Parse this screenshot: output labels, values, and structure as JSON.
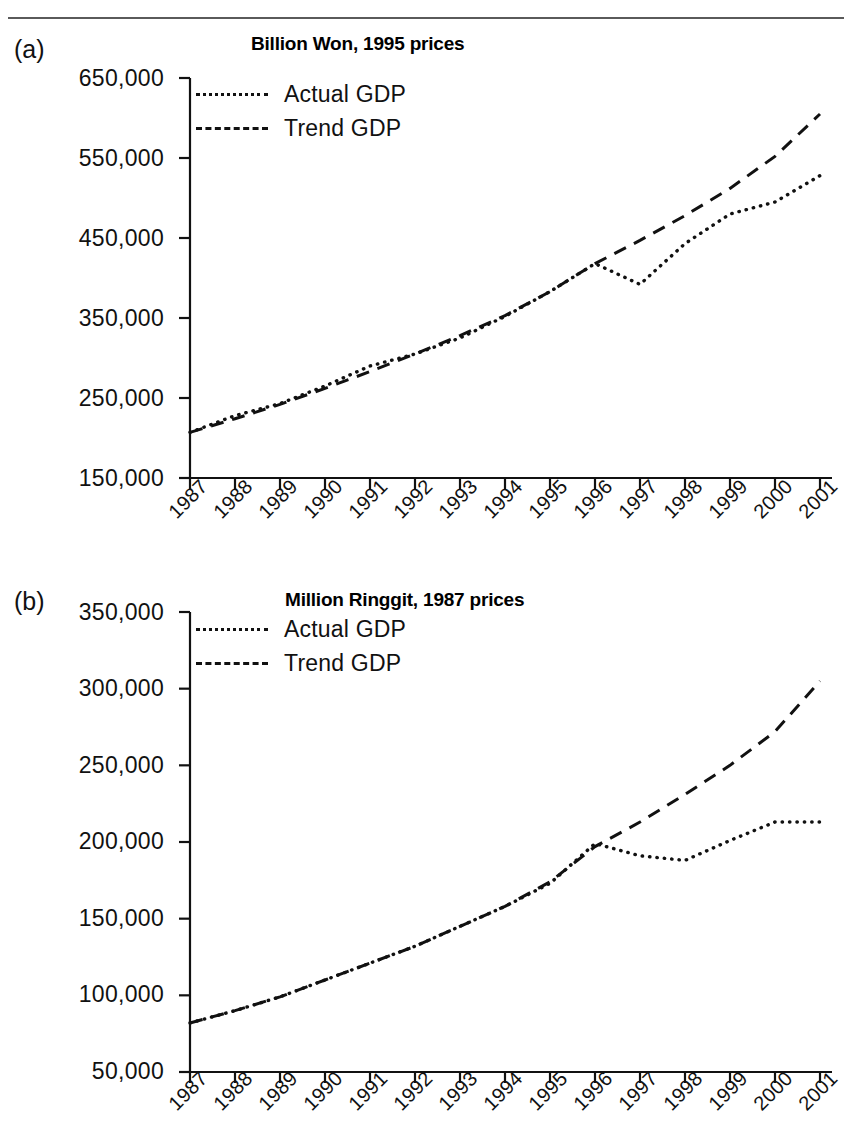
{
  "page": {
    "panels": [
      {
        "letter": "(a)",
        "title": "Billion Won, 1995 prices",
        "legend": [
          {
            "label": "Actual GDP",
            "style": "dotted"
          },
          {
            "label": "Trend GDP",
            "style": "dashed"
          }
        ],
        "ytick_labels": [
          "650,000",
          "550,000",
          "450,000",
          "350,000",
          "250,000",
          "150,000"
        ],
        "xtick_labels": [
          "1987",
          "1988",
          "1989",
          "1990",
          "1991",
          "1992",
          "1993",
          "1994",
          "1995",
          "1996",
          "1997",
          "1998",
          "1999",
          "2000",
          "2001"
        ]
      },
      {
        "letter": "(b)",
        "title": "Million Ringgit, 1987 prices",
        "legend": [
          {
            "label": "Actual GDP",
            "style": "dotted"
          },
          {
            "label": "Trend GDP",
            "style": "dashed"
          }
        ],
        "ytick_labels": [
          "350,000",
          "300,000",
          "250,000",
          "200,000",
          "150,000",
          "100,000",
          "50,000"
        ],
        "xtick_labels": [
          "1987",
          "1988",
          "1989",
          "1990",
          "1991",
          "1992",
          "1993",
          "1994",
          "1995",
          "1996",
          "1997",
          "1998",
          "1999",
          "2000",
          "2001"
        ]
      }
    ]
  },
  "chart_data": [
    {
      "type": "line",
      "panel": "(a)",
      "title": "Billion Won, 1995 prices",
      "xlabel": "",
      "ylabel": "Billion Won, 1995 prices",
      "x": [
        1987,
        1988,
        1989,
        1990,
        1991,
        1992,
        1993,
        1994,
        1995,
        1996,
        1997,
        1998,
        1999,
        2000,
        2001
      ],
      "xlim": [
        1987,
        2001
      ],
      "ylim": [
        150000,
        650000
      ],
      "yticks": [
        150000,
        250000,
        350000,
        450000,
        550000,
        650000
      ],
      "grid": false,
      "legend_position": "top-left",
      "series": [
        {
          "name": "Actual GDP",
          "style": "dotted",
          "values": [
            207000,
            228000,
            243000,
            265000,
            290000,
            305000,
            325000,
            352000,
            383000,
            418000,
            392000,
            443000,
            480000,
            495000,
            528000
          ]
        },
        {
          "name": "Trend GDP",
          "style": "dashed",
          "values": [
            207000,
            224000,
            242000,
            262000,
            283000,
            305000,
            328000,
            353000,
            383000,
            418000,
            447000,
            478000,
            512000,
            552000,
            605000
          ]
        }
      ]
    },
    {
      "type": "line",
      "panel": "(b)",
      "title": "Million Ringgit, 1987 prices",
      "xlabel": "",
      "ylabel": "Million Ringgit, 1987 prices",
      "x": [
        1987,
        1988,
        1989,
        1990,
        1991,
        1992,
        1993,
        1994,
        1995,
        1996,
        1997,
        1998,
        1999,
        2000,
        2001
      ],
      "xlim": [
        1987,
        2001
      ],
      "ylim": [
        50000,
        350000
      ],
      "yticks": [
        50000,
        100000,
        150000,
        200000,
        250000,
        300000,
        350000
      ],
      "grid": false,
      "legend_position": "top-left",
      "series": [
        {
          "name": "Actual GDP",
          "style": "dotted",
          "values": [
            82000,
            90000,
            99000,
            110000,
            121000,
            132000,
            145000,
            158000,
            173000,
            199000,
            191000,
            188000,
            201000,
            213000,
            213000,
            223000
          ]
        },
        {
          "name": "Trend GDP",
          "style": "dashed",
          "values": [
            82000,
            90000,
            99000,
            110000,
            121000,
            132000,
            145000,
            158000,
            174000,
            197000,
            213000,
            231000,
            250000,
            272000,
            305000
          ]
        }
      ]
    }
  ],
  "ghost_text": {
    "marks": [
      "",
      "",
      "",
      "",
      "",
      ""
    ]
  }
}
